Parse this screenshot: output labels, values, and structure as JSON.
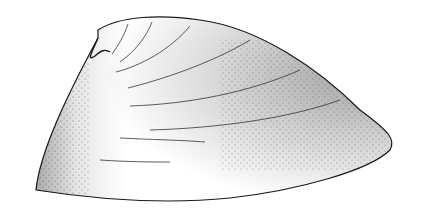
{
  "illustration": {
    "subject": "stippled shell valve drawing",
    "colors": {
      "background": "#ffffff",
      "ink": "#1a1a1a"
    }
  }
}
